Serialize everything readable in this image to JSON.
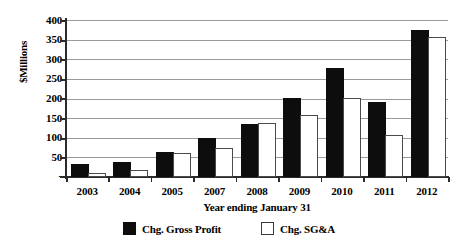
{
  "chart_data": {
    "type": "bar",
    "title": "",
    "xlabel": "Year ending January 31",
    "ylabel": "$Millions",
    "ylim": [
      0,
      400
    ],
    "ytick_labels": [
      "400",
      "350",
      "300",
      "250",
      "200",
      "150",
      "100",
      "50",
      "-"
    ],
    "ytick_values": [
      400,
      350,
      300,
      250,
      200,
      150,
      100,
      50,
      0
    ],
    "grid": true,
    "legend_position": "bottom",
    "categories": [
      "2003",
      "2004",
      "2005",
      "2007",
      "2008",
      "2009",
      "2010",
      "2011",
      "2012"
    ],
    "series": [
      {
        "name": "Chg. Gross Profit",
        "color": "#0d0d0d",
        "style": "filled",
        "values": [
          28,
          33,
          58,
          95,
          130,
          195,
          272,
          185,
          370
        ]
      },
      {
        "name": "Chg. SG&A",
        "color": "#ffffff",
        "style": "outlined",
        "values": [
          5,
          12,
          55,
          68,
          133,
          152,
          197,
          103,
          352
        ]
      }
    ]
  },
  "legend": {
    "items": [
      {
        "label": "Chg. Gross Profit",
        "swatch": "filled-square-icon"
      },
      {
        "label": "Chg. SG&A",
        "swatch": "outlined-square-icon"
      }
    ]
  }
}
